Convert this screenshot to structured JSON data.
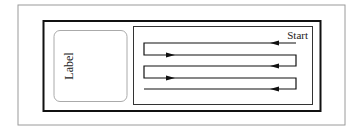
{
  "diagram": {
    "label_text": "Label",
    "start_text": "Start",
    "colors": {
      "outer_frame": "#9a9a9a",
      "thick_box": "#111111",
      "inner_box": "#333333",
      "label_box": "#aaaaaa",
      "path": "#111111"
    },
    "path": {
      "rows_y": [
        43,
        55,
        66,
        78,
        89
      ],
      "left_x": 144,
      "right_x": 296,
      "arrow_directions": [
        "left",
        "right",
        "left",
        "right",
        "left"
      ]
    }
  }
}
